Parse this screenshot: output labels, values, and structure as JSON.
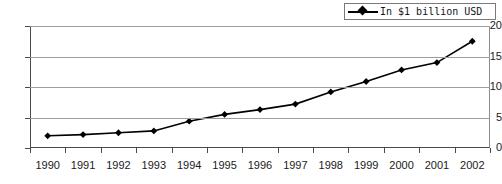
{
  "chart_data": {
    "type": "line",
    "title": "",
    "subtitle": "",
    "xlabel": "",
    "ylabel": "",
    "categories": [
      "1990",
      "1991",
      "1992",
      "1993",
      "1994",
      "1995",
      "1996",
      "1997",
      "1998",
      "1999",
      "2000",
      "2001",
      "2002"
    ],
    "series": [
      {
        "name": "In $1 billion USD",
        "marker": "diamond",
        "color": "#000000",
        "values": [
          2.0,
          2.2,
          2.5,
          2.8,
          4.4,
          5.5,
          6.3,
          7.2,
          9.2,
          10.9,
          12.8,
          14.0,
          17.5
        ]
      }
    ],
    "ylim": [
      0,
      20
    ],
    "yticks": [
      0,
      5,
      10,
      15,
      20
    ],
    "ytick_labels": [
      "0",
      "5",
      "10",
      "15",
      "20"
    ],
    "grid": "horizontal",
    "legend_position": "top-right"
  },
  "legend": {
    "label": "In $1 billion USD",
    "marker_icon": "diamond-marker-icon",
    "line_color": "#000000",
    "border_color": "#7a7a7a"
  },
  "axes": {
    "gridline_color": "#9d9d9d",
    "frame_color": "#4a4a4a"
  }
}
